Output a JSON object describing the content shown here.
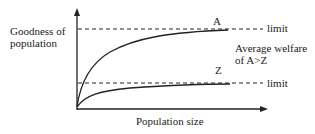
{
  "diagram": {
    "y_axis_label_line1": "Goodness of",
    "y_axis_label_line2": "population",
    "x_axis_label": "Population size",
    "curve_a_label": "A",
    "curve_z_label": "Z",
    "upper_limit_label": "limit",
    "lower_limit_label": "limit",
    "annotation_line1": "Average welfare",
    "annotation_line2": "of A>Z"
  }
}
